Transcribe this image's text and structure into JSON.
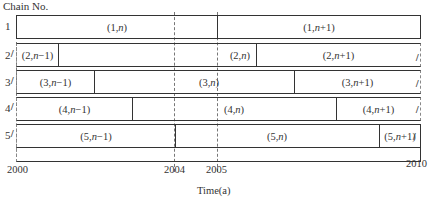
{
  "title": "Chain No.",
  "axis": {
    "xlabel": "Time(a)",
    "ticks": [
      {
        "label": "2000",
        "year": 2000
      },
      {
        "label": "2004",
        "year": 2004
      },
      {
        "label": "2005",
        "year": 2005
      },
      {
        "label": "2010",
        "year": 2010
      }
    ]
  },
  "colors": {
    "line": "#333333",
    "dashed": "#777777",
    "background": "#ffffff"
  },
  "chains": [
    {
      "number": "1",
      "segments": [
        {
          "label_pre": "(1,",
          "label_var": "n",
          "label_post": ")",
          "start": 2000,
          "end": 2005
        },
        {
          "label_pre": "(1,",
          "label_var": "n",
          "label_post": "+1)",
          "start": 2005,
          "end": 2010
        }
      ]
    },
    {
      "number": "2",
      "segments": [
        {
          "label_pre": "(2,",
          "label_var": "n",
          "label_post": "−1)",
          "start": 2000,
          "end": 2001
        },
        {
          "label_pre": "(2,",
          "label_var": "n",
          "label_post": ")",
          "start": 2001,
          "end": 2006
        },
        {
          "label_pre": "(2,",
          "label_var": "n",
          "label_post": "+1)",
          "start": 2006,
          "end": 2010
        }
      ]
    },
    {
      "number": "3",
      "segments": [
        {
          "label_pre": "(3,",
          "label_var": "n",
          "label_post": "−1)",
          "start": 2000,
          "end": 2002
        },
        {
          "label_pre": "(3,",
          "label_var": "n",
          "label_post": ")",
          "start": 2002,
          "end": 2007
        },
        {
          "label_pre": "(3,",
          "label_var": "n",
          "label_post": "+1)",
          "start": 2007,
          "end": 2010
        }
      ]
    },
    {
      "number": "4",
      "segments": [
        {
          "label_pre": "(4,",
          "label_var": "n",
          "label_post": "−1)",
          "start": 2000,
          "end": 2003
        },
        {
          "label_pre": "(4,",
          "label_var": "n",
          "label_post": ")",
          "start": 2003,
          "end": 2008
        },
        {
          "label_pre": "(4,",
          "label_var": "n",
          "label_post": "+1)",
          "start": 2008,
          "end": 2010
        }
      ]
    },
    {
      "number": "5",
      "segments": [
        {
          "label_pre": "(5,",
          "label_var": "n",
          "label_post": "−1)",
          "start": 2000,
          "end": 2004
        },
        {
          "label_pre": "(5,",
          "label_var": "n",
          "label_post": ")",
          "start": 2004,
          "end": 2009
        },
        {
          "label_pre": "(5,",
          "label_var": "n",
          "label_post": "+1)",
          "start": 2009,
          "end": 2010
        }
      ]
    }
  ]
}
